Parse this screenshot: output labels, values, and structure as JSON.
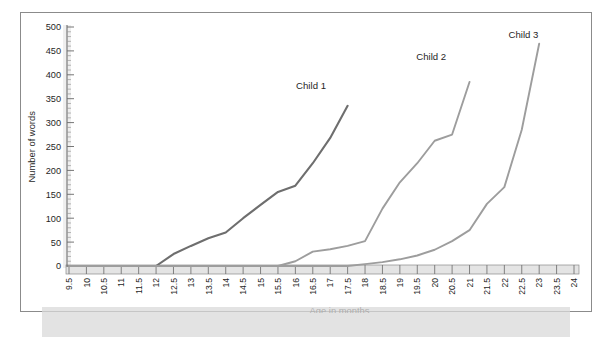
{
  "chart_data": {
    "type": "line",
    "title": "",
    "xlabel": "Age in months",
    "ylabel": "Number of words",
    "xlim": [
      9.5,
      24
    ],
    "ylim": [
      0,
      500
    ],
    "ytick_step": 50,
    "xtick_step": 0.5,
    "grid": false,
    "legend": "inline-annotations",
    "xticklabels": [
      "9.5",
      "10",
      "10.5",
      "11",
      "11.5",
      "12",
      "12.5",
      "13",
      "13.5",
      "14",
      "14.5",
      "15",
      "15.5",
      "16",
      "16.5",
      "17",
      "17.5",
      "18",
      "18.5",
      "19",
      "19.5",
      "20",
      "20.5",
      "21",
      "21.5",
      "22",
      "22.5",
      "23",
      "23.5",
      "24"
    ],
    "yticklabels": [
      "0",
      "50",
      "100",
      "150",
      "200",
      "250",
      "300",
      "350",
      "400",
      "450",
      "500"
    ],
    "series": [
      {
        "name": "Child 1",
        "color": "#6e6e6e",
        "label_x": 16.45,
        "label_y": 370,
        "x": [
          9.5,
          10,
          10.5,
          11,
          11.5,
          12,
          12.5,
          13,
          13.5,
          14,
          14.5,
          15,
          15.5,
          16,
          16.5,
          17,
          17.5
        ],
        "y": [
          0,
          0,
          0,
          0,
          0,
          0,
          25,
          42,
          58,
          70,
          100,
          128,
          155,
          168,
          215,
          268,
          335
        ]
      },
      {
        "name": "Child 2",
        "color": "#9d9d9d",
        "label_x": 19.9,
        "label_y": 430,
        "x": [
          9.5,
          10,
          10.5,
          11,
          11.5,
          12,
          12.5,
          13,
          13.5,
          14,
          14.5,
          15,
          15.5,
          16,
          16.5,
          17,
          17.5,
          18,
          18.5,
          19,
          19.5,
          20,
          20.5,
          21
        ],
        "y": [
          0,
          0,
          0,
          0,
          0,
          0,
          0,
          0,
          0,
          0,
          0,
          0,
          0,
          10,
          30,
          35,
          42,
          52,
          120,
          175,
          215,
          262,
          275,
          385
        ]
      },
      {
        "name": "Child 3",
        "color": "#9d9d9d",
        "label_x": 22.55,
        "label_y": 478,
        "x": [
          9.5,
          10,
          10.5,
          11,
          11.5,
          12,
          12.5,
          13,
          13.5,
          14,
          14.5,
          15,
          15.5,
          16,
          16.5,
          17,
          17.5,
          18,
          18.5,
          19,
          19.5,
          20,
          20.5,
          21,
          21.5,
          22,
          22.5,
          23
        ],
        "y": [
          0,
          0,
          0,
          0,
          0,
          0,
          0,
          0,
          0,
          0,
          0,
          0,
          0,
          0,
          0,
          0,
          0,
          4,
          8,
          14,
          22,
          34,
          52,
          75,
          130,
          165,
          285,
          465
        ]
      }
    ]
  }
}
